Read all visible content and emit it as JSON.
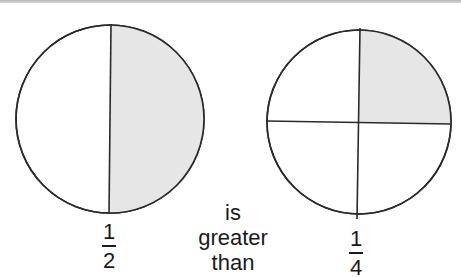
{
  "diagram": {
    "type": "fraction-comparison",
    "colors": {
      "stroke": "#2a2a2a",
      "shaded": "#e6e6e6",
      "unshaded": "#ffffff",
      "text": "#1a1a1a"
    },
    "left_circle": {
      "parts": 2,
      "shaded_parts": 1,
      "shaded_region": "right half",
      "fraction": {
        "numerator": "1",
        "denominator": "2"
      }
    },
    "right_circle": {
      "parts": 4,
      "shaded_parts": 1,
      "shaded_region": "top-right quarter",
      "fraction": {
        "numerator": "1",
        "denominator": "4"
      }
    },
    "comparison": {
      "words": [
        "is",
        "greater",
        "than"
      ]
    }
  }
}
